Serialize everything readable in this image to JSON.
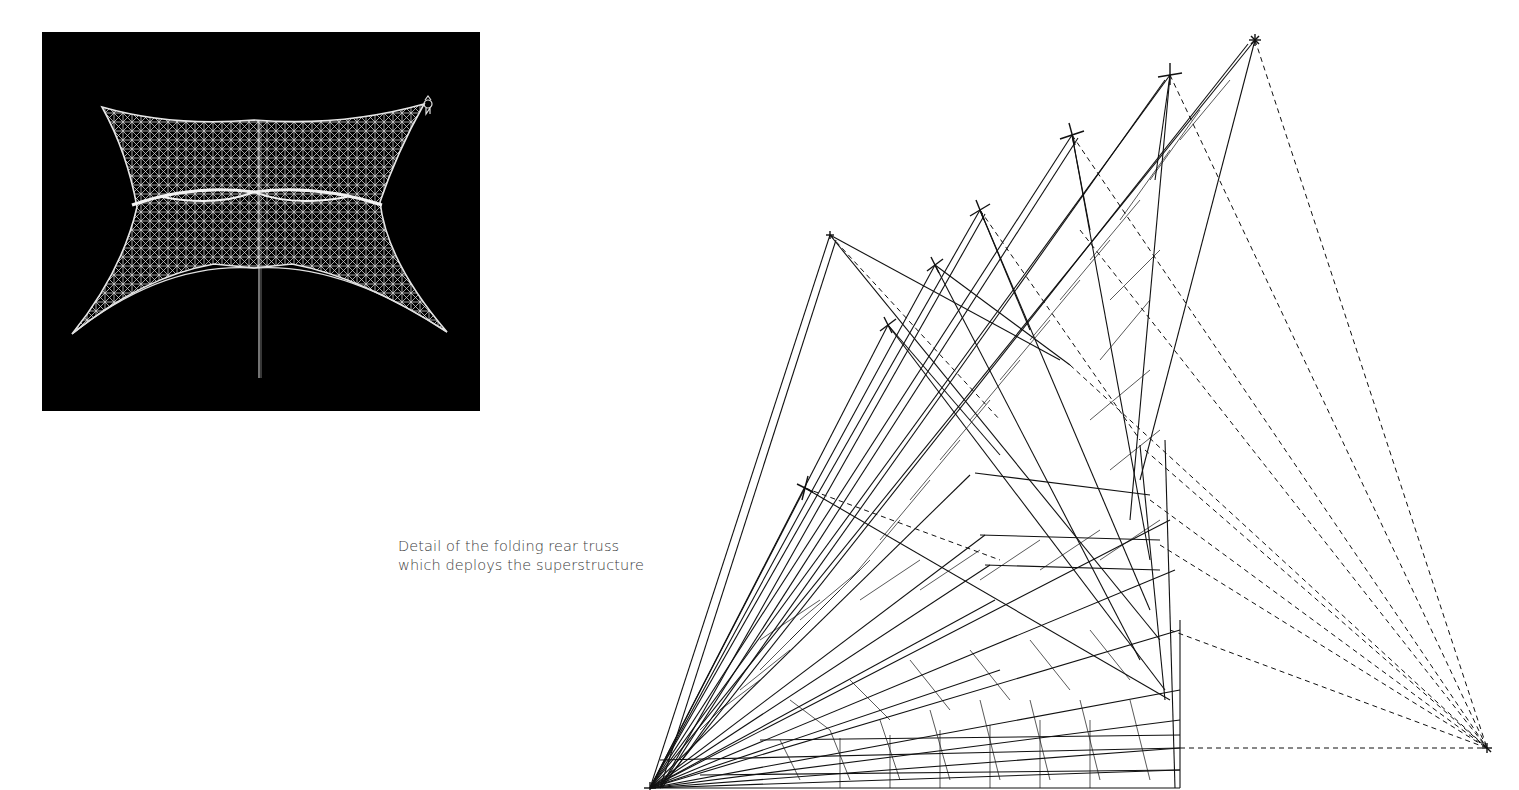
{
  "page": {
    "background": "#ffffff"
  },
  "figures": [
    {
      "id": "wireframe-render",
      "kind": "dark wireframe rendering of deployed space-frame canopy",
      "background": "#000000",
      "stroke": "#d8d8d8",
      "north_arrow_icon": "north-arrow-icon"
    },
    {
      "id": "folding-truss-drawing",
      "kind": "line drawing of folding rear truss deployment sequence",
      "stroke": "#111111"
    }
  ],
  "caption": {
    "line1": "Detail of the folding rear truss",
    "line2": "which deploys the superstructure",
    "color": "#3c3c3c"
  }
}
